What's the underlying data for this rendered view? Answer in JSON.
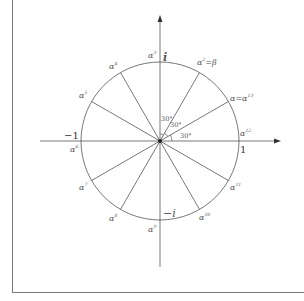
{
  "diagram": {
    "center": {
      "x": 160,
      "y": 141
    },
    "radius": 79,
    "colors": {
      "line": "#555555",
      "frame": "#777777",
      "text": "#444444"
    },
    "axes": {
      "x_label_right": "1",
      "x_label_left": "−1",
      "y_label_top": "i",
      "y_label_bottom": "−i"
    },
    "angle_labels": [
      "30°",
      "30°",
      "30°"
    ],
    "points": [
      {
        "angle": 0,
        "base": "α",
        "sup": "12",
        "suffix": ""
      },
      {
        "angle": 30,
        "base": "α=α",
        "sup": "13",
        "suffix": ""
      },
      {
        "angle": 60,
        "base": "α",
        "sup": "2",
        "suffix": "=β"
      },
      {
        "angle": 90,
        "base": "α",
        "sup": "3",
        "suffix": ""
      },
      {
        "angle": 120,
        "base": "α",
        "sup": "4",
        "suffix": ""
      },
      {
        "angle": 150,
        "base": "α",
        "sup": "5",
        "suffix": ""
      },
      {
        "angle": 180,
        "base": "α",
        "sup": "6",
        "suffix": ""
      },
      {
        "angle": 210,
        "base": "α",
        "sup": "7",
        "suffix": ""
      },
      {
        "angle": 240,
        "base": "α",
        "sup": "8",
        "suffix": ""
      },
      {
        "angle": 270,
        "base": "α",
        "sup": "9",
        "suffix": ""
      },
      {
        "angle": 300,
        "base": "α",
        "sup": "10",
        "suffix": ""
      },
      {
        "angle": 330,
        "base": "α",
        "sup": "11",
        "suffix": ""
      }
    ]
  }
}
